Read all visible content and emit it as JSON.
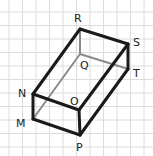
{
  "diagram": {
    "type": "rectangular-prism",
    "background": "#ffffff",
    "grid": {
      "color": "#dcdcdc",
      "spacing": 13.5,
      "offset_x": 9,
      "offset_y": 12
    },
    "edge_color": "#1a1a1a",
    "hidden_edge_color": "#8a8a8a",
    "vertices": {
      "R": {
        "x": 80,
        "y": 29
      },
      "S": {
        "x": 128,
        "y": 44
      },
      "T": {
        "x": 128,
        "y": 69
      },
      "Q": {
        "x": 80,
        "y": 54
      },
      "N": {
        "x": 33,
        "y": 94
      },
      "M": {
        "x": 33,
        "y": 119
      },
      "O": {
        "x": 79,
        "y": 110
      },
      "P": {
        "x": 80,
        "y": 135
      }
    },
    "labels": [
      {
        "text": "R",
        "x": 74,
        "y": 22
      },
      {
        "text": "S",
        "x": 133,
        "y": 46
      },
      {
        "text": "T",
        "x": 133,
        "y": 77
      },
      {
        "text": "Q",
        "x": 80,
        "y": 69
      },
      {
        "text": "N",
        "x": 18,
        "y": 97
      },
      {
        "text": "O",
        "x": 70,
        "y": 105
      },
      {
        "text": "M",
        "x": 16,
        "y": 127
      },
      {
        "text": "P",
        "x": 76,
        "y": 151
      }
    ]
  }
}
